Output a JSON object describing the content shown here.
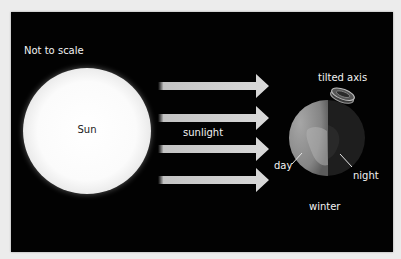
{
  "diagram": {
    "note": "Not to scale",
    "sun_label": "Sun",
    "sunlight_label": "sunlight",
    "axis_label": "tilted axis",
    "day_label": "day",
    "night_label": "night",
    "season_label": "winter",
    "arrow_count": 4,
    "colors": {
      "background": "#020202",
      "text": "#f2f2f2",
      "sun": "#ffffff",
      "arrow": "#d9d9d9",
      "earth_day": "#8a8a8a",
      "earth_night": "#1c1c1c"
    },
    "icons": [
      "sun-icon",
      "arrow-right-icon",
      "earth-icon",
      "axis-ring-icon"
    ]
  }
}
